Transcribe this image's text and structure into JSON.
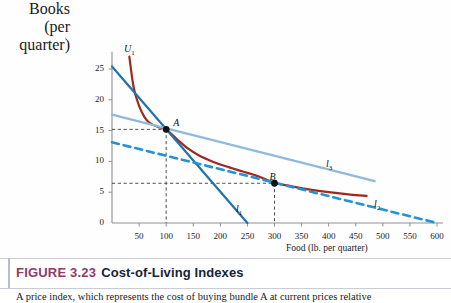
{
  "figure": {
    "number": "FIGURE 3.23",
    "title": "Cost-of-Living Indexes",
    "caption": "A price index, which represents the cost of buying bundle A at current prices relative"
  },
  "chart_data": {
    "type": "line",
    "title": "Cost-of-Living Indexes",
    "xlabel": "Food (lb. per quarter)",
    "ylabel_line1": "Books",
    "ylabel_line2": "(per quarter)",
    "xlim": [
      0,
      620
    ],
    "ylim": [
      0,
      28
    ],
    "xticks": [
      50,
      100,
      150,
      200,
      250,
      300,
      350,
      400,
      450,
      500,
      550,
      600
    ],
    "yticks": [
      0,
      5,
      10,
      15,
      20,
      25
    ],
    "grid": false,
    "legend_position": "inline-end-labels",
    "series": [
      {
        "name": "U1",
        "label": "U",
        "sub": "1",
        "kind": "indifference-curve",
        "color": "#9e2a1f",
        "dash": false,
        "width": 2.2,
        "label_x": 124,
        "label_y": 43,
        "points": [
          [
            32,
            27.0
          ],
          [
            40,
            22.0
          ],
          [
            50,
            19.0
          ],
          [
            60,
            17.2
          ],
          [
            70,
            16.2
          ],
          [
            85,
            15.6
          ],
          [
            100,
            15.2
          ],
          [
            120,
            13.6
          ],
          [
            140,
            12.1
          ],
          [
            160,
            11.0
          ],
          [
            185,
            10.0
          ],
          [
            210,
            9.2
          ],
          [
            240,
            8.4
          ],
          [
            270,
            7.6
          ],
          [
            300,
            6.5
          ],
          [
            330,
            6.0
          ],
          [
            360,
            5.5
          ],
          [
            400,
            5.0
          ],
          [
            440,
            4.6
          ],
          [
            470,
            4.4
          ]
        ]
      },
      {
        "name": "l1",
        "label": "l",
        "sub": "1",
        "kind": "budget-line",
        "color": "#1f72ad",
        "dash": false,
        "width": 2.2,
        "label_x": 236,
        "label_y": 203,
        "points": [
          [
            0,
            25.4
          ],
          [
            250,
            0
          ]
        ]
      },
      {
        "name": "l2",
        "label": "l",
        "sub": "2",
        "kind": "budget-line",
        "color": "#2393d4",
        "dash": true,
        "width": 2.6,
        "label_x": 374,
        "label_y": 198,
        "points": [
          [
            0,
            13.1
          ],
          [
            600,
            0
          ]
        ]
      },
      {
        "name": "l3",
        "label": "l",
        "sub": "3",
        "kind": "budget-line",
        "color": "#8fbadd",
        "dash": false,
        "width": 2.2,
        "label_x": 326,
        "label_y": 158,
        "points": [
          [
            0,
            17.6
          ],
          [
            485,
            6.8
          ]
        ]
      }
    ],
    "points": [
      {
        "name": "A",
        "label": "A",
        "x": 100,
        "y": 15.2,
        "dropline": true,
        "label_dx": 7,
        "label_dy": -12
      },
      {
        "name": "B",
        "label": "B",
        "x": 300,
        "y": 6.45,
        "dropline": true,
        "label_dx": -5,
        "label_dy": -12
      }
    ],
    "annotations": [
      {
        "name": "dashed-guide-A",
        "from": [
          0,
          15.2
        ],
        "to": [
          100,
          15.2
        ]
      },
      {
        "name": "dashed-guide-A-vertical",
        "from": [
          100,
          15.2
        ],
        "to": [
          100,
          0
        ]
      },
      {
        "name": "dashed-guide-B",
        "from": [
          0,
          6.45
        ],
        "to": [
          300,
          6.45
        ]
      },
      {
        "name": "dashed-guide-B-vertical",
        "from": [
          300,
          6.45
        ],
        "to": [
          300,
          0
        ]
      }
    ]
  }
}
